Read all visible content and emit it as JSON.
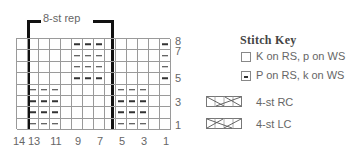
{
  "chart": {
    "repeat_label": "8-st rep",
    "columns": 14,
    "rows": 8,
    "row_labels": [
      "8",
      "7",
      "5",
      "3",
      "1"
    ],
    "column_labels": [
      "14",
      "13",
      "11",
      "9",
      "7",
      "5",
      "3",
      "1"
    ],
    "grid_rows": [
      {
        "row": 8,
        "purl_columns": [
          9,
          8,
          7,
          1
        ]
      },
      {
        "row": 7,
        "purl_columns": [
          9,
          8,
          7,
          1
        ]
      },
      {
        "row": 6,
        "purl_columns": [
          9,
          8,
          7,
          1
        ]
      },
      {
        "row": 5,
        "purl_columns": [
          9,
          8,
          7,
          1
        ]
      },
      {
        "row": 4,
        "purl_columns": [
          13,
          12,
          11,
          5,
          4,
          3
        ]
      },
      {
        "row": 3,
        "purl_columns": [
          13,
          12,
          11,
          5,
          4,
          3
        ]
      },
      {
        "row": 2,
        "purl_columns": [
          13,
          12,
          11,
          5,
          4,
          3
        ]
      },
      {
        "row": 1,
        "purl_columns": [
          13,
          12,
          11,
          5,
          4,
          3
        ]
      }
    ],
    "repeat_columns": [
      13,
      6
    ]
  },
  "key": {
    "title": "Stitch Key",
    "items": [
      {
        "symbol": "empty-square",
        "label": "K on RS, p on WS"
      },
      {
        "symbol": "dash-square",
        "label": "P on RS, k on WS"
      },
      {
        "symbol": "right-cable",
        "label": "4-st RC"
      },
      {
        "symbol": "left-cable",
        "label": "4-st LC"
      }
    ]
  }
}
